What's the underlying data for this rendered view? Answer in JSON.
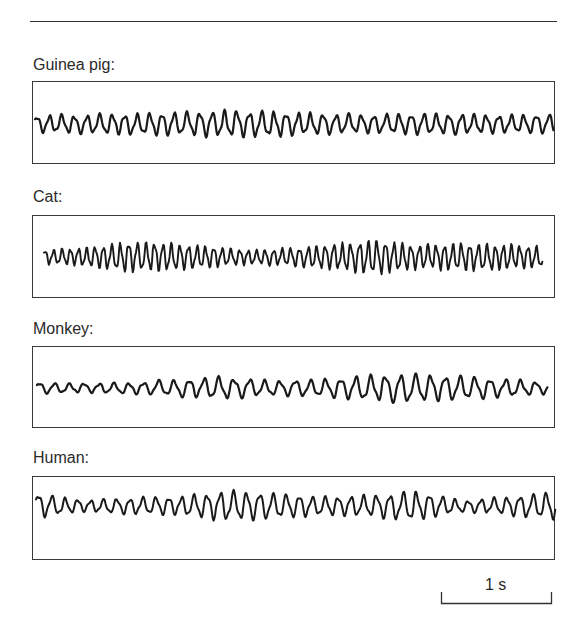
{
  "figure": {
    "panels": [
      {
        "label": "Guinea pig:"
      },
      {
        "label": "Cat:"
      },
      {
        "label": "Monkey:"
      },
      {
        "label": "Human:"
      }
    ],
    "scale_bar": {
      "label": "1 s"
    }
  },
  "chart_data": {
    "type": "line",
    "title": "",
    "xlabel": "time",
    "ylabel": "",
    "scale_bar": {
      "label": "1 s",
      "x_px": [
        441,
        552
      ]
    },
    "grid": false,
    "series": [
      {
        "name": "Guinea pig",
        "x_px": [
          35,
          554
        ],
        "center_y": 124,
        "period_px": 12.5,
        "amplitude": 9,
        "envelope": [
          0.8,
          0.9,
          1.0,
          1.1,
          1.25,
          1.2,
          1.0,
          0.85,
          1.0,
          0.95,
          0.85,
          0.9
        ]
      },
      {
        "name": "Cat",
        "x_px": [
          44,
          543
        ],
        "center_y": 257,
        "period_px": 8.5,
        "amplitude": 10,
        "envelope": [
          0.6,
          0.8,
          1.3,
          1.2,
          0.9,
          0.6,
          0.8,
          1.1,
          1.5,
          1.0,
          1.2,
          1.1,
          0.9
        ]
      },
      {
        "name": "Monkey",
        "x_px": [
          37,
          548
        ],
        "center_y": 388,
        "period_px": 15,
        "amplitude": 8,
        "envelope": [
          0.6,
          0.5,
          0.6,
          0.9,
          1.2,
          0.8,
          0.9,
          1.3,
          1.6,
          1.3,
          1.0,
          0.6
        ]
      },
      {
        "name": "Human",
        "x_px": [
          36,
          556
        ],
        "center_y": 506,
        "period_px": 13,
        "amplitude": 10,
        "envelope": [
          1.1,
          0.5,
          0.7,
          0.8,
          1.3,
          1.1,
          0.8,
          0.9,
          1.3,
          0.5,
          0.8,
          1.2
        ]
      }
    ]
  },
  "colors": {
    "trace": "#1a1a1a",
    "frame": "#3a3a3a",
    "background": "#ffffff"
  }
}
